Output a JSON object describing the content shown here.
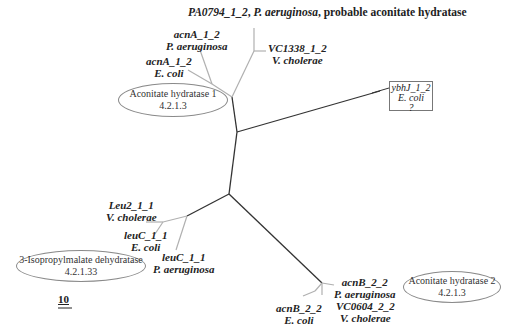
{
  "diagram": {
    "type": "unrooted phylogenetic tree",
    "scale_bar": "10",
    "groups": [
      {
        "id": "ah1",
        "name": "Aconitate hydratase 1",
        "ec": "4.2.1.3"
      },
      {
        "id": "ipmd",
        "name": "3-Isopropylmalate dehydratase",
        "ec": "4.2.1.33"
      },
      {
        "id": "ah2",
        "name": "Aconitate hydratase 2",
        "ec": "4.2.1.3"
      }
    ],
    "leaves": {
      "pa0794": {
        "gene": "PA0794_1_2",
        "organism": "P. aeruginosa",
        "note": "probable aconitate hydratase",
        "sep": ", "
      },
      "vc1338": {
        "gene": "VC1338_1_2",
        "organism": "V. cholerae"
      },
      "acnA_pa": {
        "gene": "acnA_1_2",
        "organism": "P. aeruginosa"
      },
      "acnA_ec": {
        "gene": "acnA_1_2",
        "organism": "E. coli"
      },
      "ybhJ": {
        "gene": "ybhJ_1_2",
        "organism": "E. coli",
        "note": "?"
      },
      "leu2_vc": {
        "gene": "Leu2_1_1",
        "organism": "V. cholerae"
      },
      "leuC_ec": {
        "gene": "leuC_1_1",
        "organism": "E. coli"
      },
      "leuC_pa": {
        "gene": "leuC_1_1",
        "organism": "P. aeruginosa"
      },
      "acnB_pa": {
        "gene": "acnB_2_2",
        "organism": "P. aeruginosa"
      },
      "acnB_ec": {
        "gene": "acnB_2_2",
        "organism": "E. coli"
      },
      "vc0604": {
        "gene": "VC0604_2_2",
        "organism": "V. cholerae"
      }
    },
    "colors": {
      "main_branch": "#333333",
      "leaf_branch": "#b0b0b0",
      "oval_border": "#8a8a8a"
    }
  }
}
